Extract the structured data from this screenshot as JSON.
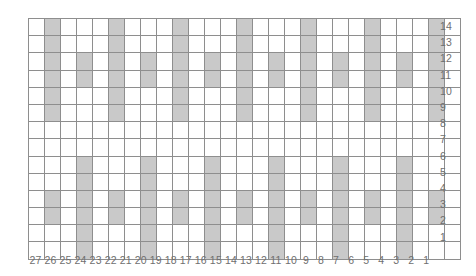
{
  "chart_data": {
    "type": "heatmap",
    "title": "",
    "subtitle": "",
    "xlabel": "",
    "ylabel": "",
    "grid": true,
    "legend_position": "none",
    "columns": 27,
    "rows": 14,
    "x_order": "right-to-left",
    "y_order": "bottom-to-top",
    "categories": [
      "27",
      "26",
      "25",
      "24",
      "23",
      "22",
      "21",
      "20",
      "19",
      "18",
      "17",
      "16",
      "15",
      "14",
      "13",
      "12",
      "11",
      "10",
      "9",
      "8",
      "7",
      "6",
      "5",
      "4",
      "3",
      "2",
      "1"
    ],
    "row_labels": [
      "14",
      "13",
      "12",
      "11",
      "10",
      "9",
      "8",
      "7",
      "6",
      "5",
      "4",
      "3",
      "2",
      "1"
    ],
    "value_legend": {
      "0": "empty stitch",
      "1": "shaded stitch"
    },
    "colors": {
      "filled": "#c9c9c9",
      "empty": "#ffffff",
      "gridline": "#8e8e8e",
      "label": "#6f6f6f"
    },
    "matrix_row_order": [
      "14",
      "13",
      "12",
      "11",
      "10",
      "9",
      "8",
      "7",
      "6",
      "5",
      "4",
      "3",
      "2",
      "1"
    ],
    "matrix_col_order": [
      "27",
      "26",
      "25",
      "24",
      "23",
      "22",
      "21",
      "20",
      "19",
      "18",
      "17",
      "16",
      "15",
      "14",
      "13",
      "12",
      "11",
      "10",
      "9",
      "8",
      "7",
      "6",
      "5",
      "4",
      "3",
      "2",
      "1"
    ],
    "matrix": [
      [
        0,
        1,
        0,
        0,
        0,
        1,
        0,
        0,
        0,
        1,
        0,
        0,
        0,
        1,
        0,
        0,
        0,
        1,
        0,
        0,
        0,
        1,
        0,
        0,
        0,
        1,
        0
      ],
      [
        0,
        1,
        0,
        0,
        0,
        1,
        0,
        0,
        0,
        1,
        0,
        0,
        0,
        1,
        0,
        0,
        0,
        1,
        0,
        0,
        0,
        1,
        0,
        0,
        0,
        1,
        0
      ],
      [
        0,
        1,
        0,
        1,
        0,
        1,
        0,
        1,
        0,
        1,
        0,
        1,
        0,
        1,
        0,
        1,
        0,
        1,
        0,
        1,
        0,
        1,
        0,
        1,
        0,
        1,
        0
      ],
      [
        0,
        1,
        0,
        1,
        0,
        1,
        0,
        1,
        0,
        1,
        0,
        1,
        0,
        1,
        0,
        1,
        0,
        1,
        0,
        1,
        0,
        1,
        0,
        1,
        0,
        1,
        0
      ],
      [
        0,
        1,
        0,
        0,
        0,
        1,
        0,
        0,
        0,
        1,
        0,
        0,
        0,
        1,
        0,
        0,
        0,
        1,
        0,
        0,
        0,
        1,
        0,
        0,
        0,
        1,
        0
      ],
      [
        0,
        1,
        0,
        0,
        0,
        1,
        0,
        0,
        0,
        1,
        0,
        0,
        0,
        1,
        0,
        0,
        0,
        1,
        0,
        0,
        0,
        1,
        0,
        0,
        0,
        1,
        0
      ],
      [
        0,
        0,
        0,
        0,
        0,
        0,
        0,
        0,
        0,
        0,
        0,
        0,
        0,
        0,
        0,
        0,
        0,
        0,
        0,
        0,
        0,
        0,
        0,
        0,
        0,
        0,
        0
      ],
      [
        0,
        0,
        0,
        0,
        0,
        0,
        0,
        0,
        0,
        0,
        0,
        0,
        0,
        0,
        0,
        0,
        0,
        0,
        0,
        0,
        0,
        0,
        0,
        0,
        0,
        0,
        0
      ],
      [
        0,
        0,
        0,
        1,
        0,
        0,
        0,
        1,
        0,
        0,
        0,
        1,
        0,
        0,
        0,
        1,
        0,
        0,
        0,
        1,
        0,
        0,
        0,
        1,
        0,
        0,
        0
      ],
      [
        0,
        0,
        0,
        1,
        0,
        0,
        0,
        1,
        0,
        0,
        0,
        1,
        0,
        0,
        0,
        1,
        0,
        0,
        0,
        1,
        0,
        0,
        0,
        1,
        0,
        0,
        0
      ],
      [
        0,
        1,
        0,
        1,
        0,
        1,
        0,
        1,
        0,
        1,
        0,
        1,
        0,
        1,
        0,
        1,
        0,
        1,
        0,
        1,
        0,
        1,
        0,
        1,
        0,
        1,
        0
      ],
      [
        0,
        1,
        0,
        1,
        0,
        1,
        0,
        1,
        0,
        1,
        0,
        1,
        0,
        1,
        0,
        1,
        0,
        1,
        0,
        1,
        0,
        1,
        0,
        1,
        0,
        1,
        0
      ],
      [
        0,
        0,
        0,
        1,
        0,
        0,
        0,
        1,
        0,
        0,
        0,
        1,
        0,
        0,
        0,
        1,
        0,
        0,
        0,
        1,
        0,
        0,
        0,
        1,
        0,
        0,
        0
      ],
      [
        0,
        0,
        0,
        1,
        0,
        0,
        0,
        1,
        0,
        0,
        0,
        1,
        0,
        0,
        0,
        1,
        0,
        0,
        0,
        1,
        0,
        0,
        0,
        1,
        0,
        0,
        0
      ]
    ]
  }
}
